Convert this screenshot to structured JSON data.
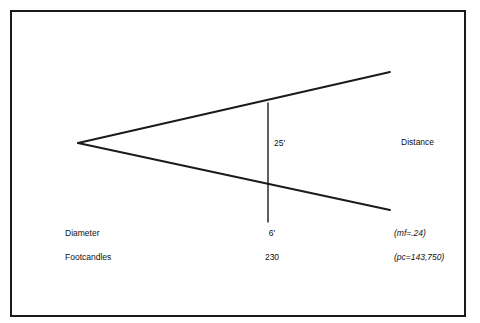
{
  "figure": {
    "background_color": "#ffffff",
    "line_color": "#1a1a1a",
    "border_color": "#1a1a1a"
  },
  "labels": {
    "beam_height": "25'",
    "distance": "Distance",
    "diameter": "Diameter",
    "diameter_value": "6'",
    "footcandles": "Footcandles",
    "footcandles_value": "230",
    "maintenance_factor": "(mf=.24)",
    "peak_candela": "(pc=143,750)"
  },
  "chart_data": {
    "type": "line",
    "xlabel": "Distance",
    "ylabel": "",
    "grid": false,
    "legend": "none",
    "xlim": [
      0,
      480
    ],
    "ylim": [
      323,
      0
    ],
    "annotations": [
      {
        "text": "25'",
        "x": 274,
        "y": 143,
        "role": "beam-height"
      },
      {
        "text": "Distance",
        "x": 401,
        "y": 142,
        "role": "axis-label"
      },
      {
        "text": "Diameter",
        "x": 65,
        "y": 233,
        "role": "row-label"
      },
      {
        "text": "6'",
        "x": 272,
        "y": 233,
        "role": "row-value"
      },
      {
        "text": "(mf=.24)",
        "x": 394,
        "y": 233,
        "role": "row-note"
      },
      {
        "text": "Footcandles",
        "x": 65,
        "y": 257,
        "role": "row-label"
      },
      {
        "text": "230",
        "x": 272,
        "y": 257,
        "role": "row-value"
      },
      {
        "text": "(pc=143,750)",
        "x": 394,
        "y": 257,
        "role": "row-note"
      }
    ],
    "series": [
      {
        "name": "upper-beam-edge",
        "x": [
          78,
          390
        ],
        "y": [
          143,
          72
        ]
      },
      {
        "name": "lower-beam-edge",
        "x": [
          78,
          390
        ],
        "y": [
          143,
          210
        ]
      },
      {
        "name": "measurement-line",
        "x": [
          268,
          268
        ],
        "y": [
          103,
          222
        ]
      }
    ],
    "table": {
      "columns": [
        "Quantity",
        "Value",
        "Note"
      ],
      "rows": [
        [
          "Diameter",
          "6'",
          "(mf=.24)"
        ],
        [
          "Footcandles",
          "230",
          "(pc=143,750)"
        ]
      ]
    }
  }
}
